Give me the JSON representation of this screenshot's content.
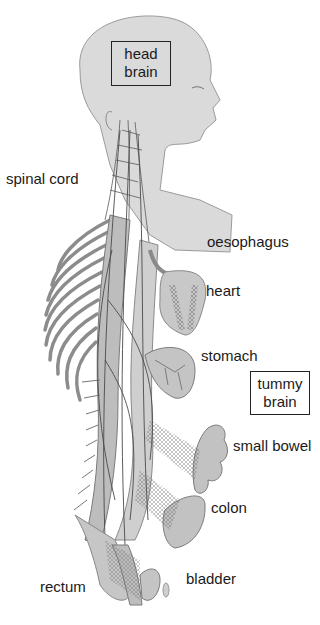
{
  "figure": {
    "colors": {
      "background": "#ffffff",
      "skin": "#d9d9d9",
      "organ": "#c4c4c4",
      "nerve": "#555555",
      "bone": "#9a9a9a",
      "text": "#1a1a1a"
    }
  },
  "boxes": {
    "head_brain": {
      "line1": "head",
      "line2": "brain"
    },
    "tummy_brain": {
      "line1": "tummy",
      "line2": "brain"
    }
  },
  "labels": {
    "spinal_cord": "spinal cord",
    "oesophagus": "oesophagus",
    "heart": "heart",
    "stomach": "stomach",
    "small_bowel": "small bowel",
    "colon": "colon",
    "rectum": "rectum",
    "bladder": "bladder"
  }
}
